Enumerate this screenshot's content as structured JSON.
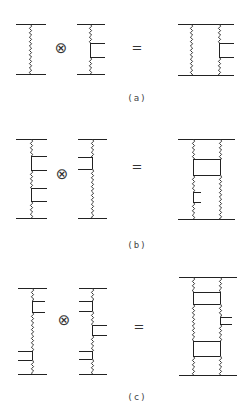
{
  "figure": {
    "panels": [
      {
        "label": "(a)",
        "operator": "⊗",
        "equals": "=",
        "label_pos": [
          137,
          98
        ],
        "op_pos": [
          61,
          48
        ],
        "eq_pos": [
          137,
          47
        ],
        "diagrams": [
          {
            "name": "factor-1",
            "hlines": [
              [
                16,
                46,
                24
              ],
              [
                16,
                46,
                74
              ]
            ],
            "verticals": [
              {
                "x": 30,
                "segments": [
                  [
                    24,
                    74,
                    "wavy"
                  ]
                ]
              }
            ],
            "rungs": []
          },
          {
            "name": "factor-2",
            "hlines": [
              [
                77,
                105,
                24
              ],
              [
                77,
                105,
                74
              ]
            ],
            "verticals": [
              {
                "x": 90,
                "segments": [
                  [
                    24,
                    43,
                    "wavy"
                  ],
                  [
                    43,
                    57,
                    "straight"
                  ],
                  [
                    57,
                    74,
                    "wavy"
                  ]
                ]
              }
            ],
            "rungs": [
              [
                90,
                105,
                43
              ],
              [
                90,
                105,
                57
              ]
            ]
          },
          {
            "name": "product",
            "hlines": [
              [
                178,
                234,
                24
              ],
              [
                178,
                234,
                75
              ]
            ],
            "verticals": [
              {
                "x": 191,
                "segments": [
                  [
                    24,
                    75,
                    "wavy"
                  ]
                ]
              },
              {
                "x": 219,
                "segments": [
                  [
                    24,
                    43,
                    "wavy"
                  ],
                  [
                    43,
                    57,
                    "straight"
                  ],
                  [
                    57,
                    75,
                    "wavy"
                  ]
                ]
              }
            ],
            "rungs": [
              [
                219,
                234,
                43
              ],
              [
                219,
                234,
                57
              ]
            ]
          }
        ]
      },
      {
        "label": "(b)",
        "operator": "⊗",
        "equals": "=",
        "label_pos": [
          137,
          245
        ],
        "op_pos": [
          62,
          174
        ],
        "eq_pos": [
          137,
          166
        ],
        "diagrams": [
          {
            "name": "factor-1",
            "hlines": [
              [
                16,
                47,
                139
              ],
              [
                16,
                47,
                218
              ]
            ],
            "verticals": [
              {
                "x": 31,
                "segments": [
                  [
                    139,
                    156,
                    "wavy"
                  ],
                  [
                    156,
                    170,
                    "straight"
                  ],
                  [
                    170,
                    188,
                    "wavy"
                  ],
                  [
                    188,
                    201,
                    "straight"
                  ],
                  [
                    201,
                    218,
                    "wavy"
                  ]
                ]
              }
            ],
            "rungs": [
              [
                31,
                47,
                156
              ],
              [
                31,
                47,
                170
              ],
              [
                31,
                47,
                188
              ],
              [
                31,
                47,
                201
              ]
            ]
          },
          {
            "name": "factor-2",
            "hlines": [
              [
                78,
                107,
                139
              ],
              [
                78,
                107,
                218
              ]
            ],
            "verticals": [
              {
                "x": 92,
                "segments": [
                  [
                    139,
                    157,
                    "wavy"
                  ],
                  [
                    157,
                    169,
                    "straight"
                  ],
                  [
                    169,
                    218,
                    "wavy"
                  ]
                ]
              }
            ],
            "rungs": [
              [
                78,
                92,
                157
              ],
              [
                78,
                92,
                169
              ]
            ]
          },
          {
            "name": "product",
            "hlines": [
              [
                178,
                235,
                139
              ],
              [
                178,
                235,
                219
              ]
            ],
            "verticals": [
              {
                "x": 193,
                "segments": [
                  [
                    139,
                    159,
                    "wavy"
                  ],
                  [
                    159,
                    175,
                    "straight"
                  ],
                  [
                    175,
                    192,
                    "wavy"
                  ],
                  [
                    192,
                    202,
                    "straight"
                  ],
                  [
                    202,
                    219,
                    "wavy"
                  ]
                ]
              },
              {
                "x": 220,
                "segments": [
                  [
                    139,
                    159,
                    "wavy"
                  ],
                  [
                    159,
                    175,
                    "straight"
                  ],
                  [
                    175,
                    219,
                    "wavy"
                  ]
                ]
              }
            ],
            "rungs": [
              [
                193,
                220,
                159
              ],
              [
                193,
                220,
                175
              ],
              [
                193,
                201,
                192
              ],
              [
                193,
                201,
                202
              ]
            ]
          }
        ]
      },
      {
        "label": "(c)",
        "operator": "⊗",
        "equals": "=",
        "label_pos": [
          137,
          397
        ],
        "op_pos": [
          64,
          320
        ],
        "eq_pos": [
          139,
          326
        ],
        "diagrams": [
          {
            "name": "factor-1",
            "hlines": [
              [
                18,
                47,
                288
              ],
              [
                18,
                47,
                374
              ]
            ],
            "verticals": [
              {
                "x": 32,
                "segments": [
                  [
                    288,
                    301,
                    "wavy"
                  ],
                  [
                    301,
                    312,
                    "straight"
                  ],
                  [
                    312,
                    351,
                    "wavy"
                  ],
                  [
                    351,
                    360,
                    "straight"
                  ],
                  [
                    360,
                    374,
                    "wavy"
                  ]
                ]
              }
            ],
            "rungs": [
              [
                32,
                45,
                301
              ],
              [
                32,
                45,
                312
              ],
              [
                18,
                32,
                351
              ],
              [
                18,
                32,
                360
              ]
            ]
          },
          {
            "name": "factor-2",
            "hlines": [
              [
                79,
                107,
                288
              ],
              [
                79,
                107,
                374
              ]
            ],
            "verticals": [
              {
                "x": 92,
                "segments": [
                  [
                    288,
                    301,
                    "wavy"
                  ],
                  [
                    301,
                    311,
                    "straight"
                  ],
                  [
                    311,
                    325,
                    "wavy"
                  ],
                  [
                    325,
                    335,
                    "straight"
                  ],
                  [
                    335,
                    351,
                    "wavy"
                  ],
                  [
                    351,
                    359,
                    "straight"
                  ],
                  [
                    359,
                    374,
                    "wavy"
                  ]
                ]
              }
            ],
            "rungs": [
              [
                79,
                92,
                301
              ],
              [
                79,
                92,
                311
              ],
              [
                92,
                107,
                325
              ],
              [
                92,
                107,
                335
              ],
              [
                79,
                92,
                351
              ],
              [
                79,
                92,
                359
              ]
            ]
          },
          {
            "name": "product",
            "hlines": [
              [
                179,
                237,
                277
              ],
              [
                179,
                237,
                375
              ]
            ],
            "verticals": [
              {
                "x": 193,
                "segments": [
                  [
                    277,
                    292,
                    "wavy"
                  ],
                  [
                    292,
                    304,
                    "straight"
                  ],
                  [
                    304,
                    341,
                    "wavy"
                  ],
                  [
                    341,
                    356,
                    "straight"
                  ],
                  [
                    356,
                    375,
                    "wavy"
                  ]
                ]
              },
              {
                "x": 220,
                "segments": [
                  [
                    277,
                    292,
                    "wavy"
                  ],
                  [
                    292,
                    304,
                    "straight"
                  ],
                  [
                    304,
                    317,
                    "wavy"
                  ],
                  [
                    317,
                    324,
                    "straight"
                  ],
                  [
                    324,
                    341,
                    "wavy"
                  ],
                  [
                    341,
                    356,
                    "straight"
                  ],
                  [
                    356,
                    375,
                    "wavy"
                  ]
                ]
              }
            ],
            "rungs": [
              [
                193,
                220,
                292
              ],
              [
                193,
                220,
                304
              ],
              [
                220,
                232,
                317
              ],
              [
                220,
                232,
                324
              ],
              [
                193,
                220,
                341
              ],
              [
                193,
                220,
                356
              ]
            ]
          }
        ]
      }
    ]
  }
}
